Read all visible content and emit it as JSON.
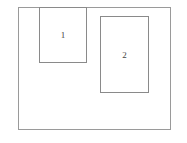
{
  "diagram": {
    "outer": {
      "label": ""
    },
    "regions": [
      {
        "id": "1",
        "label": "1"
      },
      {
        "id": "2",
        "label": "2"
      }
    ]
  }
}
